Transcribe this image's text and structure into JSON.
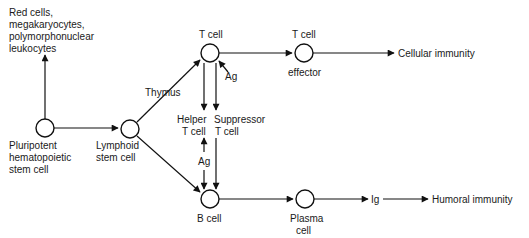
{
  "diagram": {
    "type": "flowchart",
    "title": "",
    "nodes": [
      {
        "id": "pluripotent",
        "label_lines": [
          "Pluripotent",
          "hematopoietic",
          "stem cell"
        ]
      },
      {
        "id": "lymphoid",
        "label_lines": [
          "Lymphoid",
          "stem cell"
        ]
      },
      {
        "id": "tcell",
        "label": "T cell"
      },
      {
        "id": "tcell_effector",
        "label_top": "T cell",
        "label_bottom": "effector"
      },
      {
        "id": "bcell",
        "label": "B cell"
      },
      {
        "id": "plasma",
        "label_lines": [
          "Plasma",
          "cell"
        ]
      }
    ],
    "text_labels": {
      "myeloid_lines": [
        "Red cells,",
        "megakaryocytes,",
        "polymorphonuclear",
        "leukocytes"
      ],
      "thymus": "Thymus",
      "ag_top": "Ag",
      "ag_middle": "Ag",
      "helper_lines": [
        "Helper",
        "T cell"
      ],
      "suppressor_lines": [
        "Suppressor",
        "T cell"
      ],
      "ig": "Ig",
      "cellular_immunity": "Cellular immunity",
      "humoral_immunity": "Humoral immunity"
    },
    "edges": [
      {
        "from": "pluripotent",
        "to": "myeloid"
      },
      {
        "from": "pluripotent",
        "to": "lymphoid"
      },
      {
        "from": "lymphoid",
        "to": "tcell",
        "label": "Thymus"
      },
      {
        "from": "lymphoid",
        "to": "bcell"
      },
      {
        "from": "ag",
        "to": "tcell"
      },
      {
        "from": "tcell",
        "to": "tcell_effector"
      },
      {
        "from": "tcell_effector",
        "to": "cellular_immunity"
      },
      {
        "from": "tcell",
        "to": "helper"
      },
      {
        "from": "tcell",
        "to": "suppressor"
      },
      {
        "from": "helper",
        "to": "bcell",
        "label": "Ag",
        "bidirectional": true
      },
      {
        "from": "suppressor",
        "to": "bcell"
      },
      {
        "from": "bcell",
        "to": "plasma"
      },
      {
        "from": "plasma",
        "to": "ig"
      },
      {
        "from": "ig",
        "to": "humoral_immunity"
      }
    ],
    "colors": {
      "line": "#111111",
      "text": "#1a1a1a",
      "background": "#ffffff"
    }
  }
}
